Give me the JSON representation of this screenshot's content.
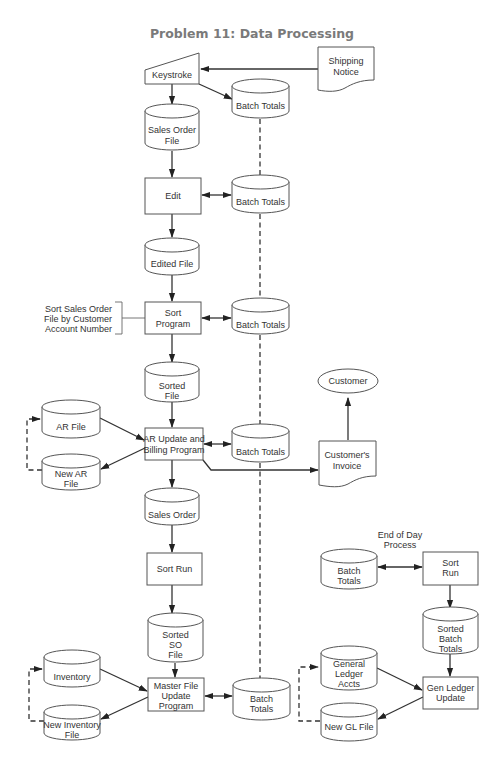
{
  "title": "Problem 11:  Data Processing",
  "nodes": {
    "keystroke": {
      "type": "manual-input",
      "lines": [
        "Keystroke"
      ]
    },
    "shipping_notice": {
      "type": "document",
      "lines": [
        "Shipping",
        "Notice"
      ]
    },
    "batch_totals_1": {
      "type": "disk",
      "lines": [
        "Batch Totals"
      ]
    },
    "sales_order_file": {
      "type": "disk",
      "lines": [
        "Sales Order",
        "File"
      ]
    },
    "edit": {
      "type": "process",
      "lines": [
        "Edit"
      ]
    },
    "batch_totals_2": {
      "type": "disk",
      "lines": [
        "Batch Totals"
      ]
    },
    "edited_file": {
      "type": "disk",
      "lines": [
        "Edited File"
      ]
    },
    "sort_program": {
      "type": "process",
      "lines": [
        "Sort",
        "Program"
      ]
    },
    "sort_annotation": {
      "type": "annotation",
      "lines": [
        "Sort Sales Order",
        "File by Customer",
        "Account Number"
      ]
    },
    "batch_totals_3": {
      "type": "disk",
      "lines": [
        "Batch Totals"
      ]
    },
    "sorted_file": {
      "type": "disk",
      "lines": [
        "Sorted",
        "File"
      ]
    },
    "customer": {
      "type": "terminal",
      "lines": [
        "Customer"
      ]
    },
    "ar_file": {
      "type": "disk",
      "lines": [
        "AR File"
      ]
    },
    "ar_update": {
      "type": "process",
      "lines": [
        "AR Update and",
        "Billing Program"
      ]
    },
    "batch_totals_4": {
      "type": "disk",
      "lines": [
        "Batch Totals"
      ]
    },
    "customers_invoice": {
      "type": "document",
      "lines": [
        "Customer's",
        "Invoice"
      ]
    },
    "new_ar_file": {
      "type": "disk",
      "lines": [
        "New AR",
        "File"
      ]
    },
    "sales_order": {
      "type": "disk",
      "lines": [
        "Sales Order"
      ]
    },
    "sort_run": {
      "type": "process",
      "lines": [
        "Sort Run"
      ]
    },
    "sorted_so_file": {
      "type": "disk",
      "lines": [
        "Sorted",
        "SO",
        "File"
      ]
    },
    "inventory": {
      "type": "disk",
      "lines": [
        "Inventory"
      ]
    },
    "master_file_update": {
      "type": "process",
      "lines": [
        "Master File",
        "Update",
        "Program"
      ]
    },
    "batch_totals_5": {
      "type": "disk",
      "lines": [
        "Batch",
        "Totals"
      ]
    },
    "new_inventory_file": {
      "type": "disk",
      "lines": [
        "New Inventory",
        "File"
      ]
    },
    "eod_label": {
      "type": "label",
      "lines": [
        "End of Day",
        "Process"
      ]
    },
    "eod_batch_totals": {
      "type": "disk",
      "lines": [
        "Batch",
        "Totals"
      ]
    },
    "eod_sort_run": {
      "type": "process",
      "lines": [
        "Sort",
        "Run"
      ]
    },
    "sorted_batch_totals": {
      "type": "disk",
      "lines": [
        "Sorted",
        "Batch",
        "Totals"
      ]
    },
    "general_ledger_accts": {
      "type": "disk",
      "lines": [
        "General",
        "Ledger",
        "Accts"
      ]
    },
    "gen_ledger_update": {
      "type": "process",
      "lines": [
        "Gen Ledger",
        "Update"
      ]
    },
    "new_gl_file": {
      "type": "disk",
      "lines": [
        "New GL File"
      ]
    }
  },
  "edges": [
    {
      "from": "shipping_notice",
      "to": "keystroke",
      "style": "solid"
    },
    {
      "from": "keystroke",
      "to": "sales_order_file",
      "style": "solid"
    },
    {
      "from": "keystroke",
      "to": "batch_totals_1",
      "style": "solid"
    },
    {
      "from": "sales_order_file",
      "to": "edit",
      "style": "solid"
    },
    {
      "from": "edit",
      "to": "batch_totals_2",
      "style": "solid-bidirectional"
    },
    {
      "from": "edit",
      "to": "edited_file",
      "style": "solid"
    },
    {
      "from": "edited_file",
      "to": "sort_program",
      "style": "solid"
    },
    {
      "from": "sort_program",
      "to": "batch_totals_3",
      "style": "solid-bidirectional"
    },
    {
      "from": "sort_program",
      "to": "sorted_file",
      "style": "solid"
    },
    {
      "from": "sorted_file",
      "to": "ar_update",
      "style": "solid"
    },
    {
      "from": "ar_file",
      "to": "ar_update",
      "style": "solid"
    },
    {
      "from": "ar_update",
      "to": "new_ar_file",
      "style": "solid"
    },
    {
      "from": "new_ar_file",
      "to": "ar_file",
      "style": "dashed"
    },
    {
      "from": "ar_update",
      "to": "batch_totals_4",
      "style": "solid-bidirectional"
    },
    {
      "from": "ar_update",
      "to": "customers_invoice",
      "style": "solid"
    },
    {
      "from": "customers_invoice",
      "to": "customer",
      "style": "solid"
    },
    {
      "from": "ar_update",
      "to": "sales_order",
      "style": "solid"
    },
    {
      "from": "sales_order",
      "to": "sort_run",
      "style": "solid"
    },
    {
      "from": "sort_run",
      "to": "sorted_so_file",
      "style": "solid"
    },
    {
      "from": "sorted_so_file",
      "to": "master_file_update",
      "style": "solid"
    },
    {
      "from": "inventory",
      "to": "master_file_update",
      "style": "solid"
    },
    {
      "from": "master_file_update",
      "to": "new_inventory_file",
      "style": "solid"
    },
    {
      "from": "new_inventory_file",
      "to": "inventory",
      "style": "dashed"
    },
    {
      "from": "master_file_update",
      "to": "batch_totals_5",
      "style": "solid-bidirectional"
    },
    {
      "from": "batch_totals_1",
      "to": "batch_totals_5",
      "style": "dashed"
    },
    {
      "from": "eod_batch_totals",
      "to": "eod_sort_run",
      "style": "solid-bidirectional"
    },
    {
      "from": "eod_sort_run",
      "to": "sorted_batch_totals",
      "style": "solid"
    },
    {
      "from": "sorted_batch_totals",
      "to": "gen_ledger_update",
      "style": "solid"
    },
    {
      "from": "general_ledger_accts",
      "to": "gen_ledger_update",
      "style": "solid"
    },
    {
      "from": "gen_ledger_update",
      "to": "new_gl_file",
      "style": "solid"
    },
    {
      "from": "new_gl_file",
      "to": "general_ledger_accts",
      "style": "dashed"
    }
  ]
}
